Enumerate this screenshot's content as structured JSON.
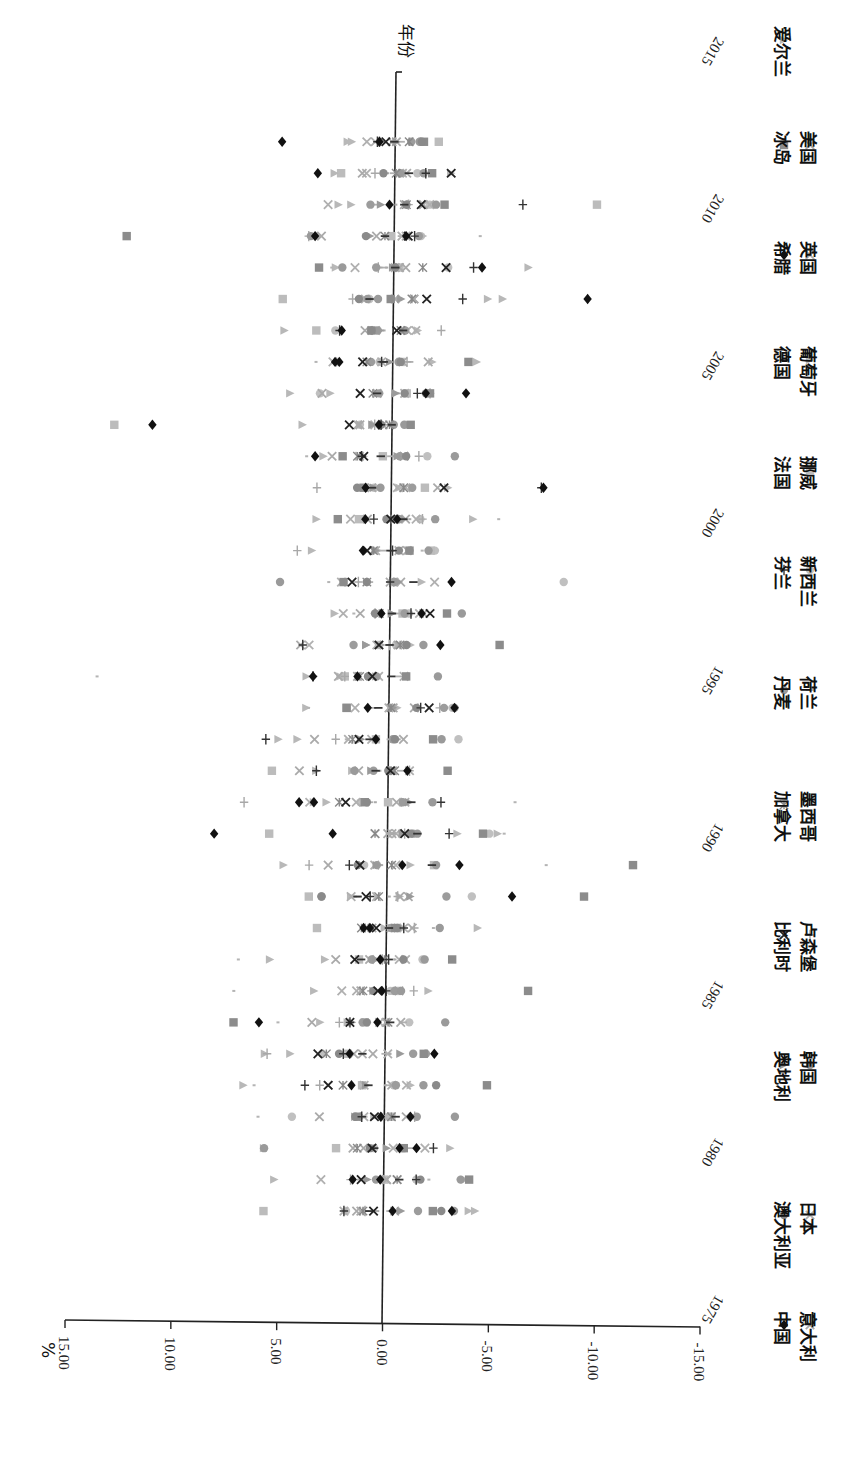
{
  "chart_data": {
    "type": "scatter",
    "orientation": "rotated-90-clockwise",
    "title": "",
    "caption_visible": false,
    "xlabel": "年份",
    "ylabel": "%",
    "x_ticks": [
      "1975",
      "1980",
      "1985",
      "1990",
      "1995",
      "2000",
      "2005",
      "2010",
      "2015"
    ],
    "y_ticks": [
      "15.00",
      "10.00",
      "5.00",
      "0.00",
      "-5.00",
      "-10.00",
      "-15.00"
    ],
    "xlim": [
      1975,
      2015
    ],
    "ylim": [
      -15,
      15
    ],
    "grid": false,
    "legend_position": "bottom",
    "years": [
      1978,
      1979,
      1980,
      1981,
      1982,
      1983,
      1984,
      1985,
      1986,
      1987,
      1988,
      1989,
      1990,
      1991,
      1992,
      1993,
      1994,
      1995,
      1996,
      1997,
      1998,
      1999,
      2000,
      2001,
      2002,
      2003,
      2004,
      2005,
      2006,
      2007,
      2008,
      2009,
      2010,
      2011,
      2012
    ],
    "series": [
      {
        "name": "中国",
        "marker": "diamond",
        "color": "#111111",
        "values": [
          -0.6,
          1.3,
          -0.9,
          0.0,
          1.4,
          1.5,
          5.8,
          0.0,
          0.1,
          0.9,
          -6.1,
          -0.9,
          8.0,
          4.0,
          -1.1,
          0.4,
          0.8,
          3.4,
          -2.6,
          0.2,
          -3.1,
          1.1,
          1.0,
          1.0,
          3.4,
          11.1,
          -1.8,
          2.5,
          2.2,
          -9.4,
          -4.4,
          3.5,
          0.0,
          3.4,
          5.1
        ]
      },
      {
        "name": "希腊",
        "marker": "diamond",
        "color": "#111111",
        "values": [
          -3.4,
          0.0,
          -1.7,
          -1.4,
          null,
          -2.5,
          0.2,
          null,
          null,
          0.6,
          null,
          -3.6,
          2.4,
          3.3,
          null,
          null,
          -3.3,
          1.3,
          null,
          -1.7,
          null,
          null,
          -0.5,
          -7.4,
          null,
          0.4,
          -3.7,
          2.3,
          null,
          null,
          null,
          -0.8,
          null,
          null,
          0.5
        ]
      },
      {
        "name": "澳大利亚",
        "marker": "dot",
        "color": "#8a8a8a",
        "values": [
          -2.9,
          -1.9,
          0.5,
          1.2,
          -2.6,
          2.0,
          0.7,
          0.4,
          -1.0,
          -0.7,
          2.9,
          1.2,
          -1.3,
          0.8,
          -0.2,
          -0.5,
          -1.5,
          0.8,
          -1.0,
          0.5,
          0.9,
          -0.6,
          0.0,
          1.4,
          -0.9,
          0.3,
          -0.8,
          -0.6,
          0.8,
          1.4,
          -0.3,
          1.1,
          -0.8,
          0.3,
          -1.5
        ]
      },
      {
        "name": "奥地利",
        "marker": "triangle",
        "color": "#9a9a9a",
        "values": [
          -1.0,
          0.6,
          -0.3,
          1.2,
          0.7,
          -0.9,
          1.4,
          0.4,
          0.3,
          -0.6,
          -1.3,
          0.3,
          -0.9,
          -1.2,
          0.6,
          1.1,
          -0.4,
          0.4,
          0.9,
          -0.3,
          -0.6,
          0.5,
          -0.8,
          0.6,
          -0.5,
          0.7,
          -0.4,
          -0.1,
          0.4,
          -0.6,
          -0.2,
          0.9,
          0.4,
          -0.6,
          -0.3
        ]
      },
      {
        "name": "比利时",
        "marker": "x",
        "color": "#222222",
        "values": [
          0.3,
          0.9,
          0.4,
          0.3,
          2.5,
          3.0,
          1.5,
          0.2,
          1.3,
          0.3,
          0.8,
          1.1,
          -1.0,
          1.8,
          -0.3,
          1.2,
          -2.1,
          0.6,
          0.3,
          -2.1,
          1.6,
          0.9,
          -0.2,
          -2.7,
          1.1,
          1.8,
          1.3,
          1.2,
          -0.4,
          -1.8,
          -2.7,
          -0.9,
          -1.5,
          -2.9,
          0.2
        ]
      },
      {
        "name": "加拿大",
        "marker": "asterisk",
        "color": "#888888",
        "values": [
          0.8,
          -0.8,
          1.1,
          -0.5,
          1.8,
          2.6,
          -0.3,
          0.9,
          -0.1,
          1.0,
          0.2,
          -0.4,
          0.4,
          2.1,
          -0.5,
          1.5,
          -0.3,
          1.2,
          -0.7,
          0.3,
          0.9,
          0.6,
          -0.4,
          -0.8,
          1.4,
          -0.1,
          0.7,
          1.0,
          -0.6,
          -1.1,
          -1.6,
          0.2,
          -0.8,
          -0.3,
          -0.9
        ]
      },
      {
        "name": "丹麦",
        "marker": "dot",
        "color": "#9c9c9c",
        "values": [
          -1.8,
          0.2,
          -1.1,
          -1.7,
          -0.7,
          -1.5,
          0.9,
          -0.6,
          0.5,
          -0.4,
          -3.0,
          0.3,
          -1.4,
          -0.9,
          0.5,
          -0.4,
          -2.8,
          0.4,
          1.5,
          -0.9,
          -0.4,
          -1.1,
          -0.6,
          -1.2,
          -0.6,
          -0.3,
          0.4,
          0.8,
          -0.8,
          1.0,
          0.6,
          -1.4,
          0.9,
          -0.5,
          -1.0
        ]
      },
      {
        "name": "芬兰",
        "marker": "plus",
        "color": "#333333",
        "values": [
          1.7,
          -1.7,
          -2.5,
          0.9,
          3.6,
          1.8,
          1.5,
          -0.2,
          -0.3,
          -1.0,
          0.6,
          1.6,
          -3.1,
          -2.7,
          3.2,
          5.6,
          -1.7,
          3.4,
          3.9,
          -1.2,
          -0.2,
          -0.3,
          0.6,
          -7.3,
          1.2,
          0.3,
          -1.4,
          0.3,
          2.3,
          -3.5,
          -4.0,
          -1.2,
          -6.3,
          -1.7,
          0.6
        ]
      },
      {
        "name": "法国",
        "marker": "tick",
        "color": "#aaaaaa",
        "values": [
          0.1,
          -0.3,
          0.4,
          0.7,
          -0.2,
          -0.4,
          0.3,
          0.2,
          -0.6,
          0.5,
          -0.3,
          0.1,
          -0.5,
          0.4,
          0.2,
          -0.7,
          -0.2,
          0.3,
          0.1,
          -0.3,
          -0.1,
          0.4,
          -1.1,
          0.2,
          -0.3,
          0.3,
          -0.5,
          0.1,
          0.2,
          -0.4,
          0.1,
          0.2,
          -0.3,
          0.1,
          0.3
        ]
      },
      {
        "name": "德国",
        "marker": "dash",
        "color": "#333333",
        "values": [
          0.5,
          -0.9,
          0.3,
          -0.7,
          0.6,
          0.9,
          -0.4,
          0.0,
          1.0,
          -0.3,
          1.2,
          -2.3,
          -1.6,
          -1.3,
          0.4,
          0.7,
          0.3,
          -0.3,
          -0.2,
          -0.3,
          -1.3,
          -0.2,
          -0.8,
          0.7,
          0.3,
          -0.2,
          0.5,
          0.2,
          -0.7,
          0.9,
          -0.3,
          0.2,
          -0.7,
          -0.9,
          -0.2
        ]
      },
      {
        "name": "冰岛",
        "marker": "square",
        "color": "#8c8c8c",
        "values": [
          -2.5,
          -4.2,
          -1.1,
          1.1,
          -5.0,
          -2.0,
          7.0,
          -6.9,
          -3.3,
          -0.6,
          -9.5,
          -11.8,
          -4.7,
          0.9,
          -3.0,
          -2.3,
          1.8,
          -1.0,
          -5.4,
          -2.9,
          2.0,
          -1.1,
          2.3,
          1.1,
          2.1,
          -1.1,
          -2.0,
          -3.8,
          0.8,
          -0.1,
          3.3,
          12.4,
          -2.6,
          -2.0,
          -1.6
        ]
      },
      {
        "name": "爱尔兰",
        "marker": "triangle",
        "color": "#b8b8b8",
        "values": [
          -4.5,
          -4.0,
          5.5,
          0.3,
          -1.4,
          5.5,
          1.6,
          3.2,
          2.7,
          -0.1,
          1.5,
          -1.3,
          -3.5,
          3.3,
          1.5,
          4.1,
          -0.6,
          3.7,
          0.9,
          -0.3,
          -1.7,
          3.5,
          -4.1,
          -2.9,
          1.1,
          4.0,
          2.7,
          -2.1,
          -1.4,
          -4.7,
          -6.6,
          -1.6,
          2.4,
          2.6,
          2.0
        ]
      },
      {
        "name": "意大利",
        "marker": "x",
        "color": "#aaaaaa",
        "values": [
          1.1,
          -0.3,
          0.8,
          2.9,
          2.5,
          1.3,
          3.3,
          -0.8,
          2.2,
          0.5,
          -1.2,
          2.6,
          -0.4,
          -1.0,
          4.0,
          3.3,
          -1.4,
          2.2,
          4.0,
          -1.8,
          -0.7,
          0.9,
          -0.9,
          -2.4,
          2.6,
          1.3,
          3.1,
          -1.9,
          0.6,
          -1.2,
          -0.5,
          3.2,
          -1.6,
          -0.8,
          -0.1
        ]
      },
      {
        "name": "日本",
        "marker": "x",
        "color": "#b0b0b0",
        "values": [
          -0.7,
          2.8,
          -2.1,
          -0.2,
          0.8,
          -0.3,
          0.1,
          1.9,
          -0.8,
          -1.0,
          1.5,
          0.4,
          -0.6,
          1.3,
          -0.4,
          1.7,
          -0.2,
          -0.9,
          0.4,
          2.0,
          -2.3,
          -0.6,
          1.7,
          -0.9,
          -0.8,
          0.6,
          1.3,
          2.6,
          -0.9,
          -1.2,
          -0.3,
          -0.6,
          -1.9,
          1.1,
          0.7
        ]
      },
      {
        "name": "韩国",
        "marker": "dot",
        "color": "#9a9a9a",
        "values": [
          -3.5,
          -3.8,
          5.5,
          -3.5,
          -2.0,
          -2.1,
          -3.0,
          -0.9,
          -2.0,
          -2.7,
          2.9,
          -2.5,
          -1.6,
          -2.3,
          1.4,
          -2.7,
          -3.3,
          -2.5,
          -1.8,
          -3.6,
          5.0,
          -2.0,
          -2.3,
          0.3,
          -3.2,
          -0.8,
          -1.8,
          -0.5,
          0.5,
          0.5,
          2.2,
          3.7,
          -2.2,
          -1.6,
          -1.4
        ]
      },
      {
        "name": "卢森堡",
        "marker": "plus",
        "color": "#a8a8a8",
        "values": [
          0.7,
          1.4,
          -0.9,
          -1.6,
          2.9,
          5.4,
          2.0,
          -1.5,
          0.0,
          -1.5,
          -0.7,
          3.5,
          -1.0,
          6.6,
          -1.2,
          2.3,
          -2.6,
          1.9,
          -0.2,
          0.5,
          1.3,
          4.2,
          -1.7,
          3.3,
          -1.5,
          0.6,
          -2.0,
          -0.9,
          -2.5,
          1.7,
          0.5,
          3.8,
          -0.9,
          0.7,
          0.5
        ]
      },
      {
        "name": "墨西哥",
        "marker": "tick",
        "color": "#b4b4b4",
        "values": [
          0.2,
          -2.3,
          -0.6,
          5.8,
          6.0,
          -0.4,
          4.9,
          7.0,
          6.8,
          -2.4,
          1.3,
          -7.7,
          -5.7,
          -6.2,
          -0.1,
          1.8,
          3.6,
          13.6,
          -0.8,
          1.5,
          2.7,
          -1.7,
          -5.3,
          -0.7,
          3.8,
          -0.3,
          -0.8,
          3.4,
          -0.6,
          -0.2,
          2.7,
          -4.3,
          -2.6,
          -0.8,
          -0.3
        ]
      },
      {
        "name": "荷兰",
        "marker": "dash",
        "color": "#b0b0b0",
        "values": [
          -0.5,
          0.9,
          -1.4,
          0.9,
          -0.4,
          -0.2,
          -1.0,
          0.5,
          -0.4,
          -0.6,
          1.2,
          0.2,
          -0.3,
          0.7,
          -0.8,
          -0.3,
          0.6,
          -0.7,
          -0.3,
          -0.6,
          0.8,
          0.2,
          -0.4,
          0.6,
          -0.2,
          0.2,
          0.5,
          -1.0,
          0.4,
          -0.3,
          0.3,
          -0.6,
          0.7,
          -0.2,
          -0.5
        ]
      },
      {
        "name": "新西兰",
        "marker": "dot",
        "color": "#c0c0c0",
        "values": [
          1.6,
          -1.7,
          0.3,
          4.2,
          -0.6,
          2.8,
          -1.3,
          -0.4,
          -1.9,
          0.6,
          -4.2,
          0.9,
          -5.0,
          1.1,
          -0.3,
          -3.5,
          -3.2,
          0.8,
          -0.5,
          -1.1,
          -8.4,
          -2.3,
          -1.6,
          0.6,
          -1.9,
          1.3,
          3.2,
          0.4,
          2.5,
          0.9,
          -2.8,
          -1.5,
          -1.9,
          -1.3,
          -1.4
        ]
      },
      {
        "name": "挪威",
        "marker": "square",
        "color": "#bcbcbc",
        "values": [
          5.5,
          -0.2,
          2.1,
          -0.5,
          0.9,
          1.6,
          0.8,
          -0.7,
          1.1,
          3.1,
          3.5,
          -2.4,
          5.4,
          -0.2,
          5.3,
          0.4,
          1.8,
          1.9,
          0.3,
          -0.8,
          -0.4,
          -2.1,
          1.3,
          -1.8,
          0.2,
          12.9,
          -0.9,
          -0.6,
          3.4,
          5.0,
          -0.5,
          -0.1,
          -9.8,
          2.3,
          -2.3
        ]
      },
      {
        "name": "葡萄牙",
        "marker": "triangle",
        "color": "#b8b8b8",
        "values": [
          -4.2,
          5.0,
          -3.3,
          -0.4,
          6.5,
          4.3,
          2.9,
          -2.2,
          5.3,
          -4.5,
          -0.8,
          4.7,
          -5.4,
          2.7,
          3.2,
          5.0,
          3.7,
          2.1,
          -1.2,
          2.4,
          -0.6,
          0.4,
          3.3,
          -0.6,
          3.0,
          0.7,
          4.6,
          -4.2,
          4.9,
          -5.4,
          2.5,
          3.3,
          1.8,
          -2.9,
          1.8
        ]
      },
      {
        "name": "英国",
        "marker": "x",
        "color": "#b0b0b0",
        "values": [
          1.7,
          -0.3,
          -0.6,
          0.8,
          -1.2,
          0.9,
          -0.2,
          1.2,
          -1.1,
          -0.4,
          0.3,
          -0.6,
          0.4,
          3.5,
          -1.2,
          0.6,
          1.4,
          0.3,
          3.6,
          -1.6,
          2.1,
          0.5,
          -1.4,
          -0.5,
          1.3,
          0.2,
          -0.8,
          0.3,
          -1.3,
          1.1,
          1.6,
          -0.8,
          2.9,
          -0.6,
          1.1
        ]
      },
      {
        "name": "美国",
        "marker": "x",
        "color": "#aaaaaa",
        "values": [
          0.9,
          -0.8,
          1.3,
          -1.2,
          -0.5,
          0.4,
          -0.9,
          1.0,
          0.6,
          -1.4,
          -0.8,
          1.1,
          -0.2,
          -0.6,
          1.2,
          -0.9,
          -0.4,
          1.3,
          -0.6,
          1.2,
          -0.2,
          -1.0,
          0.9,
          0.7,
          -0.8,
          1.4,
          0.5,
          -0.7,
          1.1,
          -0.3,
          -0.8,
          0.6,
          -0.7,
          1.3,
          -0.3
        ]
      }
    ]
  }
}
